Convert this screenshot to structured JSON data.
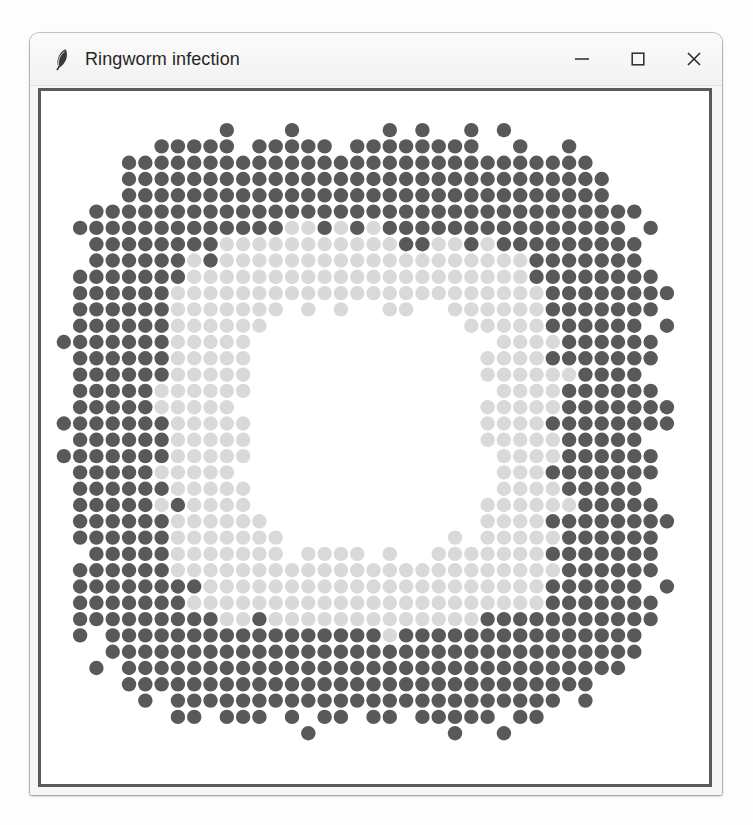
{
  "window": {
    "title": "Ringworm infection",
    "icon": "feather-icon",
    "controls": [
      {
        "name": "minimize-button",
        "glyph": "minimize-icon",
        "label": "–"
      },
      {
        "name": "maximize-button",
        "glyph": "maximize-icon",
        "label": "☐"
      },
      {
        "name": "close-button",
        "glyph": "close-icon",
        "label": "✕"
      }
    ]
  },
  "canvas": {
    "name": "simulation-canvas",
    "border_color": "#5a5a5a",
    "background": "#ffffff"
  },
  "chart_data": {
    "type": "heatmap",
    "title": "Ringworm infection",
    "xlabel": "",
    "ylabel": "",
    "grid": false,
    "legend": null,
    "cols": 40,
    "rows": 42,
    "cell_pitch_px": 16.3,
    "dot_radius_px": 7.2,
    "states": [
      {
        "id": 0,
        "name": "empty",
        "color": "#ffffff",
        "label": "empty / background"
      },
      {
        "id": 1,
        "name": "healing",
        "color": "#d9d9d9",
        "label": "healing (light grey)"
      },
      {
        "id": 2,
        "name": "infected",
        "color": "#595959",
        "label": "infected (dark grey)"
      }
    ],
    "geometry": {
      "center_col": 19.5,
      "center_row": 20.5,
      "outer_radius_cells": 18.1,
      "healing_outer_radius_cells": 12.2,
      "core_radius_cells": 7.4,
      "squareness": 4.2,
      "edge_noise": 0.9
    },
    "counts": {
      "infected_cells": 812,
      "healing_cells": 286,
      "empty_core_cells": 196
    }
  }
}
